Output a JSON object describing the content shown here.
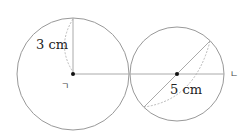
{
  "diagram": {
    "left_circle": {
      "label": "3 cm",
      "center_marker": "ㄱ"
    },
    "right_circle": {
      "label": "5 cm",
      "center_marker": "ㄴ"
    },
    "colors": {
      "stroke": "#999999",
      "dot": "#111111"
    }
  }
}
